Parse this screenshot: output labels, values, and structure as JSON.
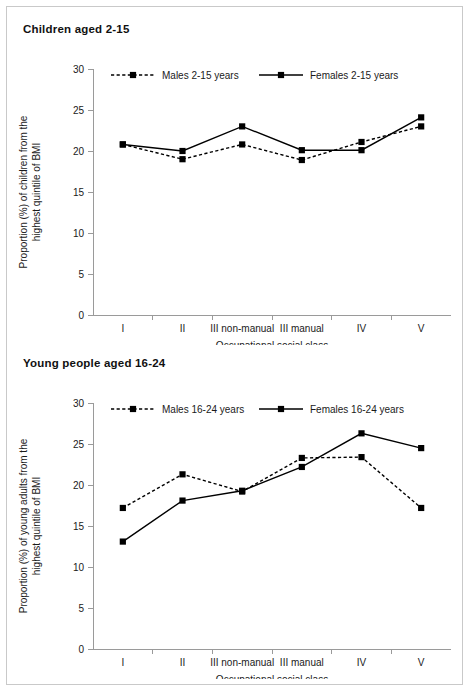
{
  "figure": {
    "background": "#ffffff",
    "frame_color": "#c9c9c9",
    "series_color": "#000000"
  },
  "panels": [
    {
      "id": "children",
      "title": "Children aged 2-15"
    },
    {
      "id": "young",
      "title": "Young people aged 16-24"
    }
  ],
  "axis": {
    "y_ticks": [
      "0",
      "5",
      "10",
      "15",
      "20",
      "25",
      "30"
    ],
    "x_categories": [
      "I",
      "II",
      "III non-manual",
      "III manual",
      "IV",
      "V"
    ],
    "x_title": "Occupational social class",
    "y_title_children_line1": "Proportion (%) of children from the",
    "y_title_children_line2": "highest quintile of BMI",
    "y_title_young_line1": "Proportion (%) of young adults from the",
    "y_title_young_line2": "highest quintile of BMI"
  },
  "chart_data": [
    {
      "type": "line",
      "title": "Children aged 2-15",
      "xlabel": "Occupational social class",
      "ylabel": "Proportion (%) of children from the highest quintile of BMI",
      "categories": [
        "I",
        "II",
        "III non-manual",
        "III manual",
        "IV",
        "V"
      ],
      "ylim": [
        0,
        30
      ],
      "yticks": [
        0,
        5,
        10,
        15,
        20,
        25,
        30
      ],
      "grid": false,
      "legend_position": "top-inside",
      "series": [
        {
          "name": "Males 2-15 years",
          "style": "dashed",
          "marker": "square",
          "color": "#000000",
          "values": [
            20.8,
            19.0,
            20.8,
            18.9,
            21.1,
            23.0
          ]
        },
        {
          "name": "Females 2-15 years",
          "style": "solid",
          "marker": "square",
          "color": "#000000",
          "values": [
            20.8,
            20.0,
            23.0,
            20.1,
            20.1,
            24.1
          ]
        }
      ]
    },
    {
      "type": "line",
      "title": "Young people aged 16-24",
      "xlabel": "Occupational social class",
      "ylabel": "Proportion (%) of young adults from the highest quintile of BMI",
      "categories": [
        "I",
        "II",
        "III non-manual",
        "III manual",
        "IV",
        "V"
      ],
      "ylim": [
        0,
        30
      ],
      "yticks": [
        0,
        5,
        10,
        15,
        20,
        25,
        30
      ],
      "grid": false,
      "legend_position": "top-inside",
      "series": [
        {
          "name": "Males 16-24 years",
          "style": "dashed",
          "marker": "square",
          "color": "#000000",
          "values": [
            17.2,
            21.3,
            19.2,
            23.3,
            23.4,
            17.2
          ]
        },
        {
          "name": "Females 16-24 years",
          "style": "solid",
          "marker": "square",
          "color": "#000000",
          "values": [
            13.1,
            18.1,
            19.3,
            22.2,
            26.3,
            24.5
          ]
        }
      ]
    }
  ]
}
